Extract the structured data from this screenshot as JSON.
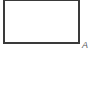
{
  "diagram": {
    "shapes": [
      {
        "type": "rectangle",
        "stroke_color": "#3a3a3a",
        "fill_color": "#ffffff"
      }
    ],
    "labels": [
      {
        "text": "A",
        "position": "bottom-right-corner"
      }
    ]
  }
}
